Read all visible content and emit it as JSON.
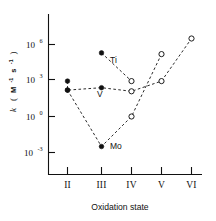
{
  "chart_data": {
    "type": "scatter",
    "title": "",
    "xlabel": "Oxidation state",
    "ylabel": "k (M^-1 s^-1)",
    "ylabel_parts": {
      "symbol": "k",
      "open_paren": "(",
      "unit_m": "M",
      "unit_m_exp": "-1",
      "unit_s": "s",
      "unit_s_exp": "-1",
      "close_paren": ")"
    },
    "x_categories": [
      "II",
      "III",
      "IV",
      "V",
      "VI"
    ],
    "y_tick_labels": [
      {
        "mantissa": "10",
        "exponent": "6",
        "log_value": 6
      },
      {
        "mantissa": "10",
        "exponent": "3",
        "log_value": 3
      },
      {
        "mantissa": "10",
        "exponent": "0",
        "log_value": 0
      },
      {
        "mantissa": "10",
        "exponent": "-3",
        "log_value": -3
      }
    ],
    "ylim_log": [
      -4.2,
      7.6
    ],
    "y_scale": "log",
    "grid": false,
    "legend": "inline-annotations",
    "series": [
      {
        "name": "Ti",
        "label": "Ti",
        "label_x_state": "III",
        "points": [
          {
            "x_state": "III",
            "log_k": 5.3,
            "marker": "filled"
          },
          {
            "x_state": "IV",
            "log_k": 2.95,
            "marker": "open"
          }
        ]
      },
      {
        "name": "V",
        "label": "V",
        "label_x_state": "III",
        "points": [
          {
            "x_state": "II",
            "log_k": 2.95,
            "marker": "filled"
          },
          {
            "x_state": "II",
            "log_k": 2.2,
            "marker": "filled"
          },
          {
            "x_state": "III",
            "log_k": 2.4,
            "marker": "filled"
          },
          {
            "x_state": "IV",
            "log_k": 2.1,
            "marker": "open"
          },
          {
            "x_state": "V",
            "log_k": 2.95,
            "marker": "open"
          },
          {
            "x_state": "VI",
            "log_k": 6.5,
            "marker": "open"
          }
        ]
      },
      {
        "name": "Mo",
        "label": "Mo",
        "label_x_state": "III",
        "points": [
          {
            "x_state": "II",
            "log_k": 2.2,
            "marker": "filled"
          },
          {
            "x_state": "III",
            "log_k": -2.5,
            "marker": "filled"
          },
          {
            "x_state": "IV",
            "log_k": 0.0,
            "marker": "open"
          },
          {
            "x_state": "V",
            "log_k": 5.2,
            "marker": "open"
          }
        ]
      }
    ],
    "annotations": [
      {
        "text": "Ti",
        "note": "series label near III-IV segment"
      },
      {
        "text": "V",
        "note": "series label below III point"
      },
      {
        "text": "Mo",
        "note": "series label right of III minimum"
      }
    ],
    "colors": {
      "ink": "#111111",
      "background": "#ffffff",
      "marker_fill_filled": "#111111",
      "marker_fill_open": "#ffffff"
    }
  }
}
